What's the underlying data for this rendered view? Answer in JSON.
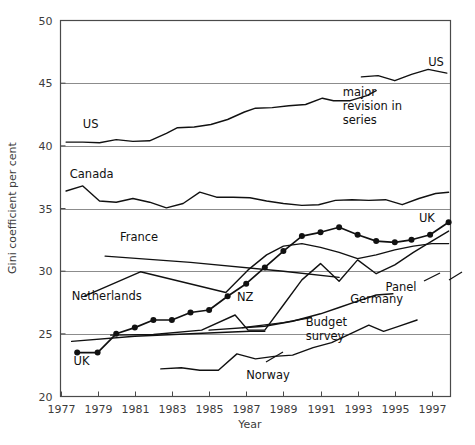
{
  "chart_data": {
    "type": "line",
    "title": "",
    "xlabel": "Year",
    "ylabel": "Gini coefficient per cent",
    "xlim": [
      1977,
      1998
    ],
    "ylim": [
      20,
      50
    ],
    "ytick_labels": [
      "20",
      "25",
      "30",
      "35",
      "40",
      "45",
      "50"
    ],
    "ytick_values": [
      20,
      25,
      30,
      35,
      40,
      45,
      50
    ],
    "xtick_labels": [
      "1977",
      "1979",
      "1981",
      "1983",
      "1985",
      "1987",
      "1989",
      "1991",
      "1993",
      "1995",
      "1997"
    ],
    "xtick_values": [
      1977,
      1979,
      1981,
      1983,
      1985,
      1987,
      1989,
      1991,
      1993,
      1995,
      1997
    ],
    "grid": "horizontal",
    "legend": "inline-labels",
    "annotations": [
      {
        "text": "major\nrevision in\nseries",
        "lines": [
          "major",
          "revision in",
          "series"
        ],
        "x": 1992.2,
        "y": 44.0
      },
      {
        "text": "Budget\nsurvey",
        "lines": [
          "Budget",
          "survey"
        ],
        "x": 1990.2,
        "y": 25.6
      }
    ],
    "series": [
      {
        "name": "US",
        "label": "US",
        "label_x": 1978.2,
        "label_y": 41.4,
        "markers": false,
        "points": [
          [
            1977.3,
            40.3
          ],
          [
            1978.2,
            40.3
          ],
          [
            1979.1,
            40.25
          ],
          [
            1980.0,
            40.5
          ],
          [
            1980.9,
            40.35
          ],
          [
            1981.8,
            40.4
          ],
          [
            1982.7,
            41.0
          ],
          [
            1983.3,
            41.45
          ],
          [
            1984.2,
            41.5
          ],
          [
            1985.1,
            41.7
          ],
          [
            1986.0,
            42.1
          ],
          [
            1986.9,
            42.7
          ],
          [
            1987.5,
            43.0
          ],
          [
            1988.4,
            43.05
          ],
          [
            1989.3,
            43.2
          ],
          [
            1990.2,
            43.3
          ],
          [
            1991.1,
            43.8
          ],
          [
            1991.7,
            43.6
          ],
          [
            1992.6,
            43.6
          ],
          [
            1993.5,
            44.0
          ],
          [
            1994.0,
            44.4
          ]
        ]
      },
      {
        "name": "US-revised",
        "label": "US",
        "label_x": 1996.8,
        "label_y": 46.4,
        "markers": false,
        "points": [
          [
            1993.2,
            45.5
          ],
          [
            1994.1,
            45.6
          ],
          [
            1995.0,
            45.2
          ],
          [
            1995.9,
            45.7
          ],
          [
            1996.8,
            46.1
          ],
          [
            1997.8,
            45.8
          ]
        ]
      },
      {
        "name": "Canada",
        "label": "Canada",
        "label_x": 1977.5,
        "label_y": 37.4,
        "markers": false,
        "points": [
          [
            1977.3,
            36.4
          ],
          [
            1978.2,
            36.8
          ],
          [
            1979.1,
            35.6
          ],
          [
            1980.0,
            35.5
          ],
          [
            1980.9,
            35.8
          ],
          [
            1981.8,
            35.5
          ],
          [
            1982.7,
            35.05
          ],
          [
            1983.6,
            35.4
          ],
          [
            1984.5,
            36.3
          ],
          [
            1985.4,
            35.9
          ],
          [
            1986.3,
            35.9
          ],
          [
            1987.2,
            35.85
          ],
          [
            1988.1,
            35.6
          ],
          [
            1989.0,
            35.4
          ],
          [
            1990.0,
            35.25
          ],
          [
            1990.9,
            35.3
          ],
          [
            1991.8,
            35.65
          ],
          [
            1992.7,
            35.7
          ],
          [
            1993.6,
            35.65
          ],
          [
            1994.5,
            35.7
          ],
          [
            1995.4,
            35.3
          ],
          [
            1996.3,
            35.8
          ],
          [
            1997.2,
            36.2
          ],
          [
            1997.9,
            36.3
          ]
        ]
      },
      {
        "name": "UK",
        "label": "UK",
        "label_x": 1977.7,
        "label_y": 22.5,
        "label2": "UK",
        "label2_x": 1996.3,
        "label2_y": 33.9,
        "markers": true,
        "points": [
          [
            1977.9,
            23.5
          ],
          [
            1979.0,
            23.5
          ],
          [
            1980.0,
            25.0
          ],
          [
            1981.0,
            25.5
          ],
          [
            1982.0,
            26.1
          ],
          [
            1983.0,
            26.1
          ],
          [
            1984.0,
            26.7
          ],
          [
            1985.0,
            26.9
          ],
          [
            1986.0,
            28.0
          ],
          [
            1987.0,
            29.0
          ],
          [
            1988.0,
            30.3
          ],
          [
            1989.0,
            31.6
          ],
          [
            1990.0,
            32.8
          ],
          [
            1991.0,
            33.1
          ],
          [
            1992.0,
            33.5
          ],
          [
            1993.0,
            32.9
          ],
          [
            1994.0,
            32.4
          ],
          [
            1995.0,
            32.3
          ],
          [
            1995.9,
            32.5
          ],
          [
            1996.9,
            32.9
          ],
          [
            1997.9,
            33.9
          ]
        ]
      },
      {
        "name": "France",
        "label": "France",
        "label_x": 1980.2,
        "label_y": 32.4,
        "markers": false,
        "points": [
          [
            1979.4,
            31.2
          ],
          [
            1984.0,
            30.7
          ],
          [
            1989.0,
            30.0
          ],
          [
            1992.0,
            29.5
          ]
        ]
      },
      {
        "name": "Netherlands",
        "label": "Netherlands",
        "label_x": 1977.6,
        "label_y": 27.7,
        "markers": false,
        "points": [
          [
            1978.3,
            28.0
          ],
          [
            1981.3,
            29.95
          ],
          [
            1985.9,
            28.3
          ],
          [
            1987.1,
            30.1
          ],
          [
            1988.1,
            31.3
          ],
          [
            1989.0,
            32.0
          ],
          [
            1990.0,
            32.2
          ],
          [
            1991.0,
            31.9
          ],
          [
            1992.0,
            31.5
          ],
          [
            1993.0,
            31.0
          ],
          [
            1994.0,
            31.3
          ],
          [
            1995.0,
            31.7
          ],
          [
            1996.0,
            32.0
          ],
          [
            1997.0,
            32.2
          ],
          [
            1997.9,
            32.2
          ]
        ]
      },
      {
        "name": "NZ",
        "label": "NZ",
        "label_x": 1986.5,
        "label_y": 27.6,
        "markers": false,
        "points": [
          [
            1979.7,
            24.9
          ],
          [
            1982.0,
            24.95
          ],
          [
            1984.6,
            25.3
          ],
          [
            1986.4,
            26.5
          ],
          [
            1987.1,
            25.3
          ],
          [
            1988.0,
            25.3
          ],
          [
            1989.0,
            27.3
          ],
          [
            1990.0,
            29.3
          ],
          [
            1991.0,
            30.6
          ],
          [
            1992.0,
            29.2
          ],
          [
            1993.0,
            30.9
          ],
          [
            1994.0,
            29.8
          ],
          [
            1995.0,
            30.5
          ],
          [
            1996.0,
            31.5
          ],
          [
            1997.0,
            32.4
          ],
          [
            1997.9,
            33.2
          ]
        ]
      },
      {
        "name": "Germany-Panel",
        "label": "Panel",
        "label_x": 1994.5,
        "label_y": 28.4,
        "markers": false,
        "points": [
          [
            1985.0,
            25.3
          ],
          [
            1988.0,
            25.6
          ],
          [
            1989.5,
            26.0
          ],
          [
            1991.0,
            26.6
          ],
          [
            1992.0,
            27.1
          ],
          [
            1993.0,
            27.6
          ],
          [
            1994.0,
            28.1
          ],
          [
            1994.9,
            28.2
          ]
        ]
      },
      {
        "name": "Germany",
        "label": "Germany",
        "label_x": 1992.6,
        "label_y": 27.5,
        "markers": false,
        "points": [
          [
            1986.8,
            25.5
          ],
          [
            1989.0,
            25.9
          ],
          [
            1990.5,
            26.3
          ]
        ]
      },
      {
        "name": "Budget-survey",
        "label": "",
        "markers": false,
        "points": [
          [
            1977.6,
            24.4
          ],
          [
            1981.0,
            24.8
          ],
          [
            1984.0,
            25.0
          ],
          [
            1987.2,
            25.2
          ],
          [
            1988.0,
            25.2
          ]
        ]
      },
      {
        "name": "Norway",
        "label": "Norway",
        "label_x": 1987.0,
        "label_y": 21.4,
        "markers": false,
        "points": [
          [
            1982.4,
            22.2
          ],
          [
            1983.5,
            22.3
          ],
          [
            1984.5,
            22.1
          ],
          [
            1985.5,
            22.1
          ],
          [
            1986.5,
            23.4
          ],
          [
            1987.5,
            23.0
          ],
          [
            1988.5,
            23.2
          ],
          [
            1989.5,
            23.3
          ],
          [
            1990.6,
            23.9
          ],
          [
            1991.6,
            24.3
          ],
          [
            1992.6,
            25.0
          ],
          [
            1993.6,
            25.7
          ],
          [
            1994.4,
            25.2
          ],
          [
            1995.2,
            25.6
          ],
          [
            1996.2,
            26.1
          ]
        ]
      }
    ]
  },
  "axes": {
    "y_title": "Gini coefficient per cent",
    "x_title": "Year"
  }
}
